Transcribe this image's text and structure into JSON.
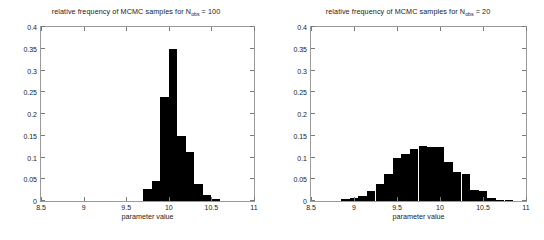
{
  "figure": {
    "background": "#ffffff",
    "bar_color": "#000000",
    "axis_color": "#9a9a9a",
    "text_color": "#1a1a1a"
  },
  "panels": [
    {
      "id": "left",
      "title_prefix": "relative frequency of MCMC samples for N",
      "title_subscript": "obs",
      "title_suffix": " = 100",
      "xlabel": "parameter value",
      "ylabel": "",
      "xticks": [
        "8.5",
        "9",
        "9.5",
        "10",
        "10.5",
        "11"
      ],
      "xtick_values": [
        8.5,
        9,
        9.5,
        10,
        10.5,
        11
      ],
      "yticks": [
        "0",
        "0.05",
        "0.1",
        "0.15",
        "0.2",
        "0.25",
        "0.3",
        "0.35",
        "0.4"
      ],
      "ytick_values": [
        0,
        0.05,
        0.1,
        0.15,
        0.2,
        0.25,
        0.3,
        0.35,
        0.4
      ]
    },
    {
      "id": "right",
      "title_prefix": "relative frequency of MCMC samples for N",
      "title_subscript": "obs",
      "title_suffix": " = 20",
      "xlabel": "parameter value",
      "ylabel": "",
      "xticks": [
        "8.5",
        "9",
        "9.5",
        "10",
        "10.5",
        "11"
      ],
      "xtick_values": [
        8.5,
        9,
        9.5,
        10,
        10.5,
        11
      ],
      "yticks": [
        "0",
        "0.05",
        "0.1",
        "0.15",
        "0.2",
        "0.25",
        "0.3",
        "0.35",
        "0.4"
      ],
      "ytick_values": [
        0,
        0.05,
        0.1,
        0.15,
        0.2,
        0.25,
        0.3,
        0.35,
        0.4
      ]
    }
  ],
  "chart_data": [
    {
      "type": "bar",
      "title": "relative frequency of MCMC samples for N_obs = 100",
      "xlabel": "parameter value",
      "ylabel": "relative frequency",
      "xlim": [
        8.5,
        11.0
      ],
      "ylim": [
        0,
        0.4
      ],
      "grid": false,
      "legend": "none",
      "bin_width": 0.1,
      "bin_left_edges": [
        9.7,
        9.8,
        9.9,
        10.0,
        10.1,
        10.2,
        10.3,
        10.4,
        10.5
      ],
      "values": [
        0.027,
        0.045,
        0.24,
        0.35,
        0.15,
        0.112,
        0.04,
        0.013,
        0.004
      ]
    },
    {
      "type": "bar",
      "title": "relative frequency of MCMC samples for N_obs = 20",
      "xlabel": "parameter value",
      "ylabel": "relative frequency",
      "xlim": [
        8.5,
        11.0
      ],
      "ylim": [
        0,
        0.4
      ],
      "grid": false,
      "legend": "none",
      "bin_width": 0.1,
      "bin_left_edges": [
        8.85,
        8.95,
        9.05,
        9.15,
        9.25,
        9.35,
        9.45,
        9.55,
        9.65,
        9.75,
        9.85,
        9.95,
        10.05,
        10.15,
        10.25,
        10.35,
        10.45,
        10.55,
        10.65,
        10.75
      ],
      "values": [
        0.004,
        0.007,
        0.012,
        0.022,
        0.038,
        0.062,
        0.1,
        0.108,
        0.12,
        0.127,
        0.124,
        0.124,
        0.089,
        0.066,
        0.062,
        0.025,
        0.022,
        0.006,
        0.003,
        0.002
      ]
    }
  ]
}
